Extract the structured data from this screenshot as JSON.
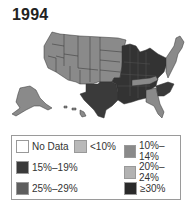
{
  "title": "1994",
  "colors": {
    "no_data": "#ffffff",
    "lt10": "#b9b9b9",
    "p10_14": "#8a8a8a",
    "p15_19": "#3a3a3a",
    "p20_24": "#b2b2b2",
    "p25_29": "#5e5e5e",
    "ge30": "#2a2a2a",
    "border": "#333333"
  },
  "legend": {
    "items": [
      {
        "label": "No Data",
        "key": "no_data"
      },
      {
        "label": "<10%",
        "key": "lt10"
      },
      {
        "label": "10%–14%",
        "key": "p10_14"
      },
      {
        "label": "15%–19%",
        "key": "p15_19"
      },
      {
        "label": "20%–24%",
        "key": "p20_24"
      },
      {
        "label": "25%–29%",
        "key": "p25_29"
      },
      {
        "label": "≥30%",
        "key": "ge30"
      }
    ]
  }
}
